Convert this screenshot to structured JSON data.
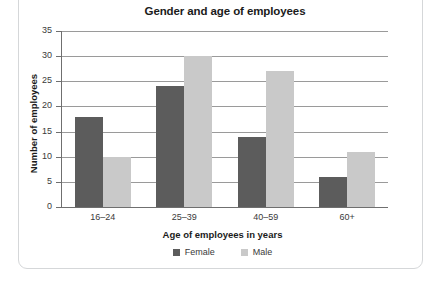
{
  "chart_data": {
    "type": "bar",
    "title": "Gender and age of employees",
    "xlabel": "Age of employees in years",
    "ylabel": "Number of employees",
    "categories": [
      "16–24",
      "25–39",
      "40–59",
      "60+"
    ],
    "series": [
      {
        "name": "Female",
        "color": "#5c5c5c",
        "values": [
          18,
          24,
          14,
          6
        ]
      },
      {
        "name": "Male",
        "color": "#c9c9c9",
        "values": [
          10,
          30,
          27,
          11
        ]
      }
    ],
    "ylim": [
      0,
      35
    ],
    "yticks": [
      0,
      5,
      10,
      15,
      20,
      25,
      30,
      35
    ],
    "ytick_labels": [
      "0",
      "5",
      "10",
      "15",
      "20",
      "25",
      "30",
      "35"
    ],
    "grid": "horizontal",
    "legend_position": "bottom"
  },
  "legend": {
    "items": [
      {
        "label": "Female",
        "swatch": "legend-swatch-female"
      },
      {
        "label": "Male",
        "swatch": "legend-swatch-male"
      }
    ]
  }
}
